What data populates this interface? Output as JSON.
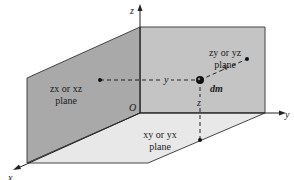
{
  "diagram": {
    "axes": {
      "x_label": "x",
      "y_label": "y",
      "z_label": "z",
      "origin_label": "O"
    },
    "planes": {
      "zy": {
        "line1": "zy or yz",
        "line2": "plane"
      },
      "zx": {
        "line1": "zx or xz",
        "line2": "plane"
      },
      "xy": {
        "line1": "xy or yx",
        "line2": "plane"
      }
    },
    "element": {
      "label": "dm",
      "dist_y": "y",
      "dist_x": "x",
      "dist_z": "z"
    },
    "colors": {
      "back_wall": "#c4c4c4",
      "side_wall": "#a9a9a9",
      "floor": "#e8e8e8",
      "lines": "#2a2a2a"
    }
  }
}
